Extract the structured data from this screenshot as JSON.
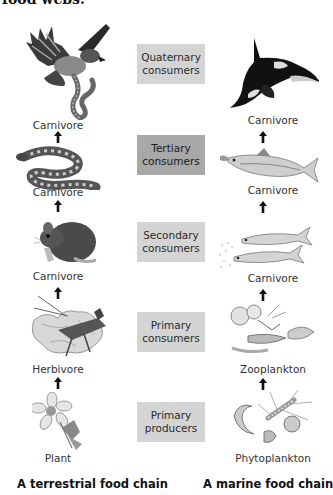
{
  "heading": "food webs.",
  "levels": [
    {
      "line1": "Quaternary",
      "line2": "consumers"
    },
    {
      "line1": "Tertiary",
      "line2": "consumers"
    },
    {
      "line1": "Secondary",
      "line2": "consumers"
    },
    {
      "line1": "Primary",
      "line2": "consumers"
    },
    {
      "line1": "Primary",
      "line2": "producers"
    }
  ],
  "terrestrial": {
    "caption": "A terrestrial food chain",
    "organisms": [
      {
        "label": "Carnivore",
        "icon": "hawk-icon"
      },
      {
        "label": "Carnivore",
        "icon": "snake-icon"
      },
      {
        "label": "Carnivore",
        "icon": "mouse-icon"
      },
      {
        "label": "Herbivore",
        "icon": "grasshopper-icon"
      },
      {
        "label": "Plant",
        "icon": "flower-icon"
      }
    ]
  },
  "marine": {
    "caption": "A marine food chain",
    "organisms": [
      {
        "label": "Carnivore",
        "icon": "orca-icon"
      },
      {
        "label": "Carnivore",
        "icon": "tuna-icon"
      },
      {
        "label": "Carnivore",
        "icon": "herring-icon"
      },
      {
        "label": "Zooplankton",
        "icon": "zooplankton-icon"
      },
      {
        "label": "Phytoplankton",
        "icon": "phytoplankton-icon"
      }
    ]
  },
  "colors": {
    "box_light": "#d4d4d4",
    "box_dark": "#a8a8a8",
    "arrow": "#111111"
  }
}
